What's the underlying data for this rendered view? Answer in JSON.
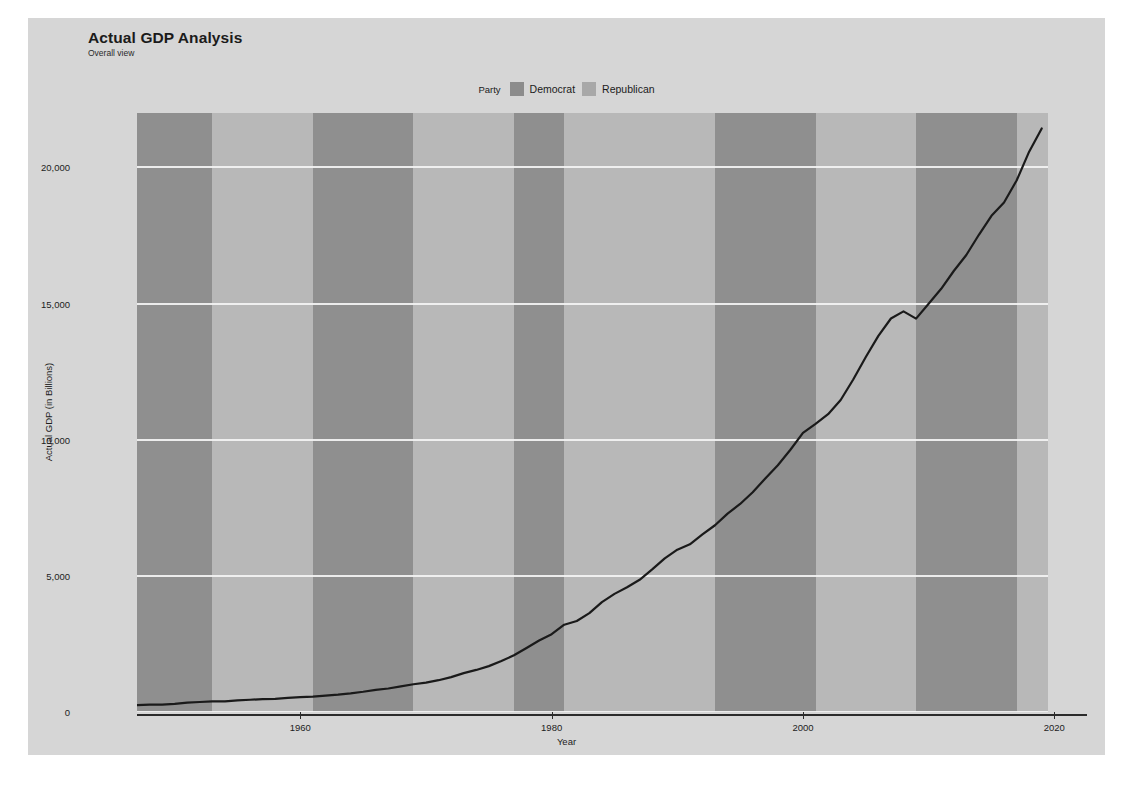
{
  "header": {
    "title": "Actual GDP Analysis",
    "subtitle": "Overall view"
  },
  "legend": {
    "title": "Party",
    "items": [
      {
        "label": "Democrat",
        "color": "#8c8c8c"
      },
      {
        "label": "Republican",
        "color": "#a8a8a8"
      }
    ]
  },
  "colors": {
    "panel": "#d6d6d6",
    "plot_base": "#b0b0b0",
    "democrat_band": "#8f8f8f",
    "republican_band": "#b8b8b8",
    "gridline": "#f1f1f1",
    "line": "#1a1a1a",
    "axis": "#2b2b2b"
  },
  "chart_data": {
    "type": "line",
    "title": "Actual GDP Analysis",
    "subtitle": "Overall view",
    "xlabel": "Year",
    "ylabel": "Actual GDP (in Billions)",
    "xlim": [
      1947,
      2019.5
    ],
    "ylim": [
      0,
      22000
    ],
    "xticks": [
      1960,
      1980,
      2000,
      2020
    ],
    "xticklabels": [
      "1960",
      "1980",
      "2000",
      "2020"
    ],
    "yticks": [
      0,
      5000,
      10000,
      15000,
      20000
    ],
    "yticklabels": [
      "0",
      "5,000",
      "10,000",
      "15,000",
      "20,000"
    ],
    "grid": "horizontal",
    "legend_position": "top-center",
    "series": [
      {
        "name": "Actual GDP",
        "color": "#1a1a1a",
        "x": [
          1947,
          1948,
          1949,
          1950,
          1951,
          1952,
          1953,
          1954,
          1955,
          1956,
          1957,
          1958,
          1959,
          1960,
          1961,
          1962,
          1963,
          1964,
          1965,
          1966,
          1967,
          1968,
          1969,
          1970,
          1971,
          1972,
          1973,
          1974,
          1975,
          1976,
          1977,
          1978,
          1979,
          1980,
          1981,
          1982,
          1983,
          1984,
          1985,
          1986,
          1987,
          1988,
          1989,
          1990,
          1991,
          1992,
          1993,
          1994,
          1995,
          1996,
          1997,
          1998,
          1999,
          2000,
          2001,
          2002,
          2003,
          2004,
          2005,
          2006,
          2007,
          2008,
          2009,
          2010,
          2011,
          2012,
          2013,
          2014,
          2015,
          2016,
          2017,
          2018,
          2019
        ],
        "y": [
          249,
          274,
          272,
          300,
          347,
          367,
          389,
          391,
          426,
          450,
          474,
          482,
          522,
          543,
          563,
          605,
          638,
          685,
          743,
          815,
          862,
          942,
          1020,
          1076,
          1168,
          1282,
          1429,
          1545,
          1685,
          1873,
          2082,
          2352,
          2627,
          2857,
          3207,
          3344,
          3634,
          4038,
          4339,
          4580,
          4855,
          5236,
          5642,
          5963,
          6158,
          6520,
          6859,
          7287,
          7640,
          8073,
          8578,
          9063,
          9631,
          10251,
          10582,
          10936,
          11458,
          12214,
          13037,
          13815,
          14452,
          14713,
          14449,
          14992,
          15543,
          16197,
          16785,
          17527,
          18225,
          18715,
          19519,
          20580,
          21433
        ]
      }
    ],
    "party_bands": [
      {
        "start": 1947,
        "end": 1953,
        "party": "Democrat"
      },
      {
        "start": 1953,
        "end": 1961,
        "party": "Republican"
      },
      {
        "start": 1961,
        "end": 1969,
        "party": "Democrat"
      },
      {
        "start": 1969,
        "end": 1977,
        "party": "Republican"
      },
      {
        "start": 1977,
        "end": 1981,
        "party": "Democrat"
      },
      {
        "start": 1981,
        "end": 1993,
        "party": "Republican"
      },
      {
        "start": 1993,
        "end": 2001,
        "party": "Democrat"
      },
      {
        "start": 2001,
        "end": 2009,
        "party": "Republican"
      },
      {
        "start": 2009,
        "end": 2017,
        "party": "Democrat"
      },
      {
        "start": 2017,
        "end": 2019.5,
        "party": "Republican"
      }
    ]
  }
}
